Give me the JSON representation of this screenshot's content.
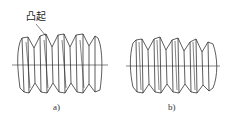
{
  "figure": {
    "panels": [
      {
        "id": "a",
        "caption": "a)",
        "annotation": "凸起"
      },
      {
        "id": "b",
        "caption": "b)"
      }
    ],
    "colors": {
      "line": "#333333",
      "background": "#ffffff"
    }
  }
}
